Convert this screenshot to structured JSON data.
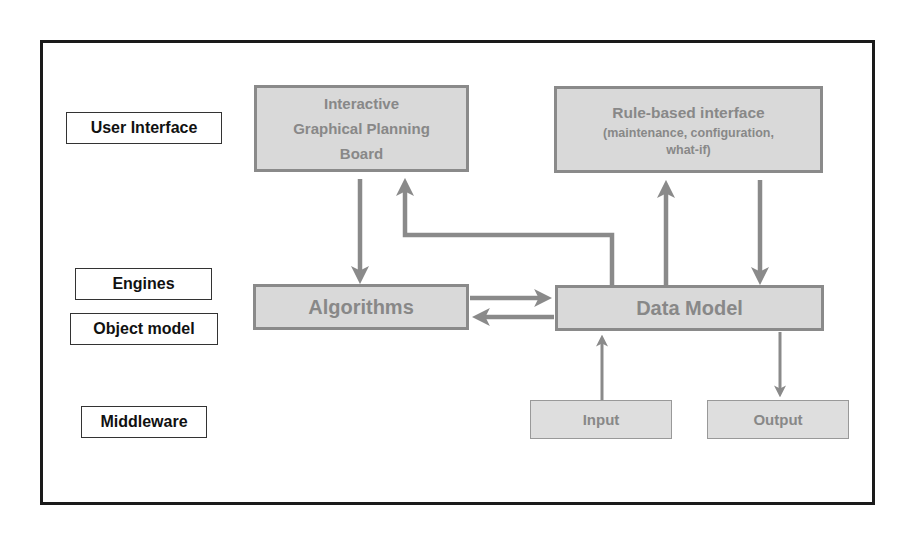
{
  "layers": {
    "user_interface": "User Interface",
    "engines": "Engines",
    "object_model": "Object model",
    "middleware": "Middleware"
  },
  "nodes": {
    "planning_board": {
      "lines": [
        "Interactive",
        "Graphical Planning",
        "Board"
      ]
    },
    "rule_based": {
      "title": "Rule-based interface",
      "sub1": "(maintenance, configuration,",
      "sub2": "what-if)"
    },
    "algorithms": "Algorithms",
    "data_model": "Data Model",
    "input": "Input",
    "output": "Output"
  },
  "colors": {
    "node_fill": "#d9d9d9",
    "node_border": "#8a8a8a",
    "node_text": "#888888",
    "arrow": "#8a8a8a",
    "frame": "#1a1a1a"
  },
  "edges": [
    {
      "from": "planning_board",
      "to": "algorithms"
    },
    {
      "from": "data_model",
      "to": "planning_board"
    },
    {
      "from": "data_model",
      "to": "rule_based"
    },
    {
      "from": "rule_based",
      "to": "data_model"
    },
    {
      "from": "algorithms",
      "to": "data_model"
    },
    {
      "from": "data_model",
      "to": "algorithms"
    },
    {
      "from": "input",
      "to": "data_model"
    },
    {
      "from": "data_model",
      "to": "output"
    }
  ]
}
